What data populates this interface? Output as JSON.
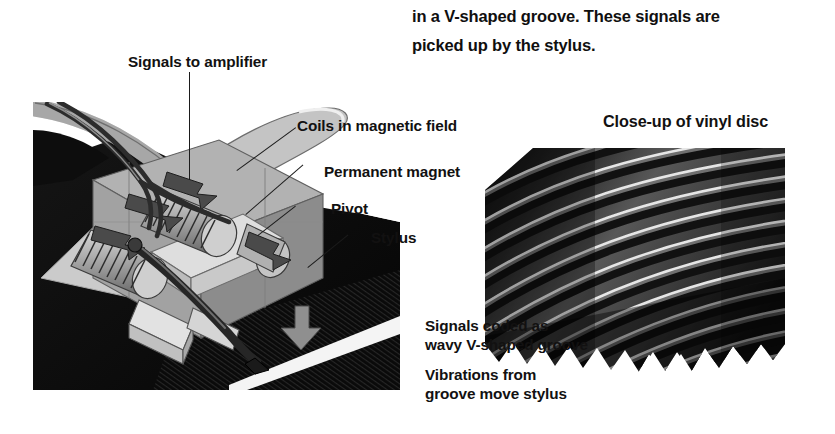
{
  "document": {
    "paragraph": {
      "lines": [
        "in a V-shaped groove. These signals are",
        "picked up by the stylus."
      ]
    }
  },
  "diagram_cartridge": {
    "name": "pickup-cartridge-cutaway",
    "labels": {
      "signals_to_amplifier": "Signals to amplifier",
      "coils_in_magnetic_field": "Coils in magnetic field",
      "permanent_magnet": "Permanent magnet",
      "pivot": "Pivot",
      "stylus": "Stylus"
    }
  },
  "diagram_vinyl": {
    "name": "vinyl-disc-closeup",
    "title": "Close-up of vinyl disc",
    "captions": {
      "signals_coded": "Signals coded as\nwavy V-shaped groove",
      "vibrations": "Vibrations from\ngroove move stylus"
    }
  },
  "colors": {
    "background": "#ffffff",
    "text": "#121111",
    "shadow_black": "#0a0a0a",
    "body_gray": "#9d9d9d",
    "light_gray": "#cfcfcf",
    "mid_gray": "#7a7a7a",
    "dark_gray": "#3a3a3a",
    "highlight": "#e8e8e8"
  }
}
